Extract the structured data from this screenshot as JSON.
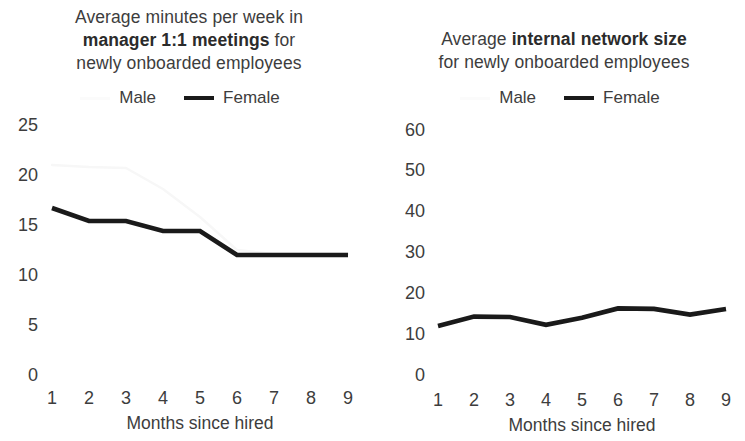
{
  "charts": {
    "left": {
      "title_line1": "Average minutes per week in",
      "title_bold": "manager 1:1 meetings",
      "title_line2_tail": " for",
      "title_line3": "newly onboarded employees",
      "legend": {
        "male": "Male",
        "female": "Female"
      },
      "xlabel": "Months since hired",
      "yticks": [
        "25",
        "20",
        "15",
        "10",
        "5",
        "0"
      ],
      "xticks": [
        "1",
        "2",
        "3",
        "4",
        "5",
        "6",
        "7",
        "8",
        "9"
      ]
    },
    "right": {
      "title_lead": "Average ",
      "title_bold": "internal network size",
      "title_line2": "for newly onboarded employees",
      "legend": {
        "male": "Male",
        "female": "Female"
      },
      "xlabel": "Months since hired",
      "yticks": [
        "60",
        "50",
        "40",
        "30",
        "20",
        "10",
        "0"
      ],
      "xticks": [
        "1",
        "2",
        "3",
        "4",
        "5",
        "6",
        "7",
        "8",
        "9"
      ]
    }
  },
  "colors": {
    "female_line": "#1a1a1a",
    "male_line": "#f7f7f7",
    "text": "#3d3d3d"
  },
  "chart_data": [
    {
      "type": "line",
      "id": "manager-1on1-minutes",
      "title": "Average minutes per week in manager 1:1 meetings for newly onboarded employees",
      "xlabel": "Months since hired",
      "ylabel": "",
      "x": [
        1,
        2,
        3,
        4,
        5,
        6,
        7,
        8,
        9
      ],
      "categories": [
        "1",
        "2",
        "3",
        "4",
        "5",
        "6",
        "7",
        "8",
        "9"
      ],
      "ylim": [
        0,
        25
      ],
      "yticks": [
        0,
        5,
        10,
        15,
        20,
        25
      ],
      "grid": false,
      "legend_position": "top",
      "series": [
        {
          "name": "Male",
          "values": [
            21.0,
            20.8,
            20.7,
            18.6,
            15.8,
            12.5,
            12.1,
            12.1,
            12.1
          ]
        },
        {
          "name": "Female",
          "values": [
            16.7,
            15.4,
            15.4,
            14.4,
            14.4,
            12.0,
            12.0,
            12.0,
            12.0
          ]
        }
      ]
    },
    {
      "type": "line",
      "id": "internal-network-size",
      "title": "Average internal network size for newly onboarded employees",
      "xlabel": "Months since hired",
      "ylabel": "",
      "x": [
        1,
        2,
        3,
        4,
        5,
        6,
        7,
        8,
        9
      ],
      "categories": [
        "1",
        "2",
        "3",
        "4",
        "5",
        "6",
        "7",
        "8",
        "9"
      ],
      "ylim": [
        0,
        60
      ],
      "yticks": [
        0,
        10,
        20,
        30,
        40,
        50,
        60
      ],
      "grid": false,
      "legend_position": "top",
      "series": [
        {
          "name": "Male",
          "values": [
            null,
            null,
            null,
            null,
            null,
            null,
            null,
            null,
            null
          ]
        },
        {
          "name": "Female",
          "values": [
            12.0,
            14.3,
            14.2,
            12.3,
            14.0,
            16.3,
            16.2,
            14.8,
            16.2
          ]
        }
      ]
    }
  ]
}
